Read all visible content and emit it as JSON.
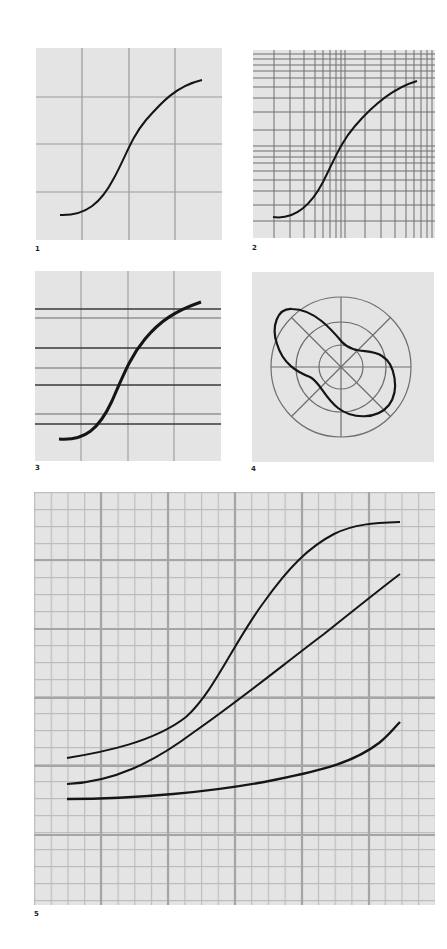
{
  "figures": [
    {
      "label": "1",
      "kind": "s-curve on uniform coarse grid",
      "grid": "4x4 uniform"
    },
    {
      "label": "2",
      "kind": "s-curve on logarithmic grid",
      "grid": "log-log, 2 decades"
    },
    {
      "label": "3",
      "kind": "s-curve with heavy horizontal reference lines",
      "grid": "uniform verticals, paired horizontals"
    },
    {
      "label": "4",
      "kind": "polar plot with peanut-shaped curve",
      "grid": "3 concentric circles, 4 radial lines"
    },
    {
      "label": "5",
      "kind": "three curves on fine graph paper",
      "grid": "major + minor millimetre grid"
    }
  ],
  "colors": {
    "paper": "#e4e4e4",
    "grid_minor": "#b8b8b8",
    "grid_major": "#9a9a9a",
    "curve": "#151515"
  }
}
